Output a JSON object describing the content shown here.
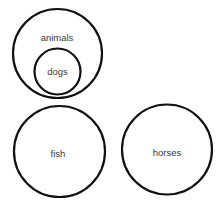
{
  "diagram": {
    "type": "euler-diagram",
    "colors": {
      "stroke": "#111111",
      "text": "#3a3a3a",
      "background": "#ffffff"
    },
    "sets": [
      {
        "id": "animals",
        "label": "animals",
        "cx": 57.5,
        "cy": 53.5,
        "r": 44.5,
        "label_x": 57,
        "label_y": 41,
        "contains": [
          "dogs"
        ]
      },
      {
        "id": "dogs",
        "label": "dogs",
        "cx": 57.5,
        "cy": 71.5,
        "r": 23,
        "label_x": 57.5,
        "label_y": 75,
        "contained_in": "animals"
      },
      {
        "id": "fish",
        "label": "fish",
        "cx": 59.5,
        "cy": 151.5,
        "r": 45.5,
        "label_x": 58,
        "label_y": 157
      },
      {
        "id": "horses",
        "label": "horses",
        "cx": 167,
        "cy": 149.5,
        "r": 45,
        "label_x": 167,
        "label_y": 156
      }
    ]
  }
}
